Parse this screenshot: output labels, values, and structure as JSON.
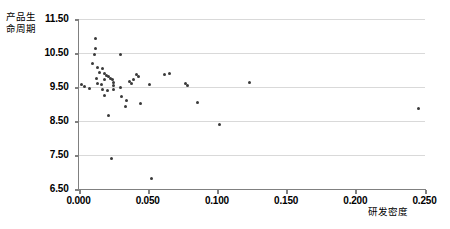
{
  "chart_data": {
    "type": "scatter",
    "title": "",
    "xlabel": "研发密度",
    "ylabel": "产品生命周期",
    "ylabel_lines": [
      "产品生",
      "命周期"
    ],
    "xlim": [
      0.0,
      0.25
    ],
    "ylim": [
      6.5,
      11.5
    ],
    "xticks": [
      "0.000",
      "0.050",
      "0.100",
      "0.150",
      "0.200",
      "0.250"
    ],
    "xtick_values": [
      0.0,
      0.05,
      0.1,
      0.15,
      0.2,
      0.25
    ],
    "yticks": [
      "11.50",
      "10.50",
      "9.50",
      "8.50",
      "7.50",
      "6.50"
    ],
    "ytick_values": [
      11.5,
      10.5,
      9.5,
      8.5,
      7.5,
      6.5
    ],
    "grid": true,
    "gridlines_y": [
      10.5,
      9.5,
      8.5,
      7.5
    ],
    "legend": null,
    "marker_color": "#3a3a3a",
    "marker_size": 3,
    "points": [
      {
        "x": 0.0125,
        "y": 10.92
      },
      {
        "x": 0.0125,
        "y": 10.62
      },
      {
        "x": 0.0115,
        "y": 10.44
      },
      {
        "x": 0.03,
        "y": 10.44
      },
      {
        "x": 0.01,
        "y": 10.17
      },
      {
        "x": 0.014,
        "y": 10.06
      },
      {
        "x": 0.017,
        "y": 10.03
      },
      {
        "x": 0.015,
        "y": 9.92
      },
      {
        "x": 0.0185,
        "y": 9.88
      },
      {
        "x": 0.02,
        "y": 9.82
      },
      {
        "x": 0.0215,
        "y": 9.8
      },
      {
        "x": 0.013,
        "y": 9.74
      },
      {
        "x": 0.019,
        "y": 9.72
      },
      {
        "x": 0.023,
        "y": 9.74
      },
      {
        "x": 0.0245,
        "y": 9.7
      },
      {
        "x": 0.042,
        "y": 9.86
      },
      {
        "x": 0.043,
        "y": 9.78
      },
      {
        "x": 0.062,
        "y": 9.84
      },
      {
        "x": 0.066,
        "y": 9.88
      },
      {
        "x": 0.002,
        "y": 9.56
      },
      {
        "x": 0.0045,
        "y": 9.49
      },
      {
        "x": 0.014,
        "y": 9.6
      },
      {
        "x": 0.0165,
        "y": 9.55
      },
      {
        "x": 0.025,
        "y": 9.62
      },
      {
        "x": 0.0255,
        "y": 9.52
      },
      {
        "x": 0.0255,
        "y": 9.42
      },
      {
        "x": 0.037,
        "y": 9.64
      },
      {
        "x": 0.0385,
        "y": 9.58
      },
      {
        "x": 0.04,
        "y": 9.7
      },
      {
        "x": 0.051,
        "y": 9.55
      },
      {
        "x": 0.017,
        "y": 9.4
      },
      {
        "x": 0.021,
        "y": 9.38
      },
      {
        "x": 0.008,
        "y": 9.44
      },
      {
        "x": 0.03,
        "y": 9.48
      },
      {
        "x": 0.0185,
        "y": 9.25
      },
      {
        "x": 0.031,
        "y": 9.22
      },
      {
        "x": 0.035,
        "y": 9.08
      },
      {
        "x": 0.045,
        "y": 9.0
      },
      {
        "x": 0.077,
        "y": 9.6
      },
      {
        "x": 0.079,
        "y": 9.52
      },
      {
        "x": 0.1235,
        "y": 9.62
      },
      {
        "x": 0.246,
        "y": 8.86
      },
      {
        "x": 0.086,
        "y": 9.02
      },
      {
        "x": 0.102,
        "y": 8.38
      },
      {
        "x": 0.022,
        "y": 8.66
      },
      {
        "x": 0.034,
        "y": 8.92
      },
      {
        "x": 0.024,
        "y": 7.38
      },
      {
        "x": 0.053,
        "y": 6.78
      }
    ]
  }
}
